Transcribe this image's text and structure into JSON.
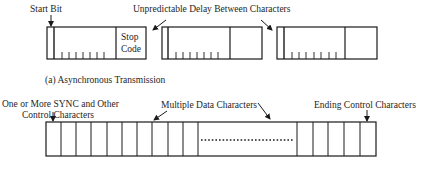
{
  "async": {
    "start_bit_label": "Start Bit",
    "delay_label": "Unpredictable Delay Between Characters",
    "stop_code_line1": "Stop",
    "stop_code_line2": "Code",
    "caption": "(a)  Asynchronous Transmission",
    "characters": [
      {
        "x": 47,
        "start_line": 54,
        "divider": 116,
        "end": 146,
        "ticks": [
          60,
          68,
          76,
          84,
          92,
          100,
          108
        ],
        "has_stop_label": true
      },
      {
        "x": 162,
        "start_line": 168,
        "divider": 230,
        "end": 262,
        "ticks": [
          175,
          183,
          191,
          199,
          207,
          215,
          223
        ],
        "has_stop_label": false
      },
      {
        "x": 277,
        "start_line": 284,
        "divider": 345,
        "end": 377,
        "ticks": [
          291,
          299,
          307,
          315,
          323,
          331,
          339
        ],
        "has_stop_label": false
      }
    ]
  },
  "sync": {
    "sync_label_line1": "One or More SYNC and Other",
    "sync_label_line2": "Control Characters",
    "data_label": "Multiple Data Characters",
    "ending_label": "Ending Control Characters",
    "frame": {
      "x1": 46,
      "x2": 376,
      "y1": 122,
      "y2": 156
    },
    "leading_dividers": [
      61,
      76,
      91,
      107,
      122,
      137,
      152,
      168,
      183,
      198
    ],
    "dotted_gap": {
      "x1": 200,
      "x2": 295,
      "y": 140
    },
    "trailing_dividers": [
      297,
      313,
      328,
      344,
      360
    ]
  }
}
